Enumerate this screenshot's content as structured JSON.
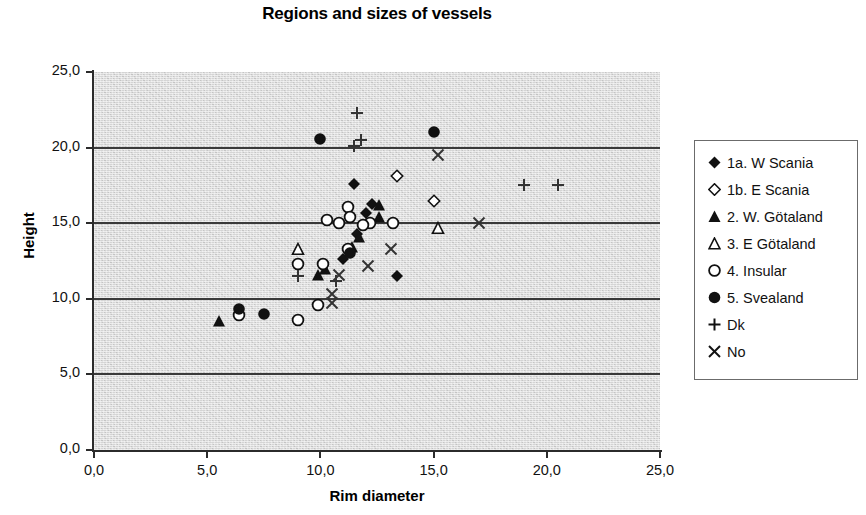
{
  "chart_data": {
    "type": "scatter",
    "title": "Regions and sizes of vessels",
    "xlabel": "Rim diameter",
    "ylabel": "Height",
    "xlim": [
      0,
      25
    ],
    "ylim": [
      0,
      25
    ],
    "xticks": [
      "0,0",
      "5,0",
      "10,0",
      "15,0",
      "20,0",
      "25,0"
    ],
    "yticks": [
      "0,0",
      "5,0",
      "10,0",
      "15,0",
      "20,0",
      "25,0"
    ],
    "xtick_values": [
      0,
      5,
      10,
      15,
      20,
      25
    ],
    "ytick_values": [
      0,
      5,
      10,
      15,
      20,
      25
    ],
    "grid": "horizontal",
    "legend_position": "right",
    "plot_background": "#d4d4d4",
    "series": [
      {
        "name": "1a. W Scania",
        "marker": "filled-diamond",
        "color": "#111111",
        "points": [
          [
            11.5,
            17.6
          ],
          [
            12.3,
            16.3
          ],
          [
            12.0,
            15.7
          ],
          [
            11.6,
            14.3
          ],
          [
            11.3,
            13.2
          ],
          [
            11.0,
            12.6
          ],
          [
            13.4,
            11.5
          ]
        ]
      },
      {
        "name": "1b. E Scania",
        "marker": "open-diamond",
        "color": "#111111",
        "points": [
          [
            13.4,
            18.1
          ],
          [
            15.0,
            16.5
          ]
        ]
      },
      {
        "name": "2. W. Götaland",
        "marker": "filled-triangle",
        "color": "#111111",
        "points": [
          [
            12.6,
            16.2
          ],
          [
            12.6,
            15.4
          ],
          [
            11.7,
            14.1
          ],
          [
            11.4,
            13.4
          ],
          [
            10.2,
            12.0
          ],
          [
            9.9,
            11.6
          ],
          [
            5.5,
            8.5
          ]
        ]
      },
      {
        "name": "3. E Götaland",
        "marker": "open-triangle",
        "color": "#111111",
        "points": [
          [
            9.0,
            13.3
          ],
          [
            15.2,
            14.7
          ]
        ]
      },
      {
        "name": "4. Insular",
        "marker": "open-circle",
        "color": "#111111",
        "points": [
          [
            11.2,
            16.1
          ],
          [
            10.3,
            15.2
          ],
          [
            10.8,
            15.0
          ],
          [
            11.3,
            15.4
          ],
          [
            12.2,
            15.0
          ],
          [
            13.2,
            15.0
          ],
          [
            11.9,
            14.9
          ],
          [
            11.2,
            13.3
          ],
          [
            10.1,
            12.3
          ],
          [
            9.0,
            12.3
          ],
          [
            9.9,
            9.6
          ],
          [
            9.0,
            8.6
          ],
          [
            6.4,
            8.9
          ]
        ]
      },
      {
        "name": "5. Svealand",
        "marker": "filled-circle",
        "color": "#111111",
        "points": [
          [
            10.0,
            20.6
          ],
          [
            15.0,
            21.0
          ],
          [
            11.3,
            13.0
          ],
          [
            6.4,
            9.3
          ],
          [
            7.5,
            9.0
          ]
        ]
      },
      {
        "name": "Dk",
        "marker": "plus",
        "color": "#333333",
        "points": [
          [
            11.6,
            22.3
          ],
          [
            11.8,
            20.5
          ],
          [
            11.5,
            20.1
          ],
          [
            9.0,
            11.5
          ],
          [
            10.7,
            11.2
          ],
          [
            19.0,
            17.5
          ],
          [
            20.5,
            17.5
          ]
        ]
      },
      {
        "name": "No",
        "marker": "cross",
        "color": "#333333",
        "points": [
          [
            15.2,
            19.5
          ],
          [
            17.0,
            15.0
          ],
          [
            13.1,
            13.3
          ],
          [
            12.1,
            12.2
          ],
          [
            10.8,
            11.6
          ],
          [
            10.5,
            10.3
          ],
          [
            10.5,
            9.7
          ]
        ]
      }
    ]
  },
  "legend": {
    "items": [
      {
        "label": "1a. W Scania",
        "marker": "filled-diamond"
      },
      {
        "label": "1b. E Scania",
        "marker": "open-diamond"
      },
      {
        "label": "2. W. Götaland",
        "marker": "filled-triangle"
      },
      {
        "label": "3. E Götaland",
        "marker": "open-triangle"
      },
      {
        "label": "4. Insular",
        "marker": "open-circle"
      },
      {
        "label": "5. Svealand",
        "marker": "filled-circle"
      },
      {
        "label": "Dk",
        "marker": "plus"
      },
      {
        "label": "No",
        "marker": "cross"
      }
    ]
  }
}
